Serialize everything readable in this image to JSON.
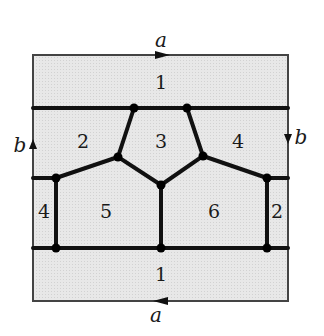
{
  "diagram": {
    "type": "torus-map-graph",
    "square": {
      "x": 33,
      "y": 55,
      "w": 255,
      "h": 246,
      "fill": "#e6e6e6",
      "stroke": "#444444"
    },
    "edge_labels": {
      "top": "a",
      "bottom": "a",
      "left": "b",
      "right": "b"
    },
    "region_labels": {
      "r1_top": "1",
      "r2": "2",
      "r3": "3",
      "r4": "4",
      "r4_left": "4",
      "r5": "5",
      "r6": "6",
      "r2_right": "2",
      "r1_bottom": "1"
    },
    "vertices": [
      {
        "x": 134,
        "y": 108
      },
      {
        "x": 187,
        "y": 108
      },
      {
        "x": 118,
        "y": 157
      },
      {
        "x": 203,
        "y": 156
      },
      {
        "x": 161,
        "y": 185
      },
      {
        "x": 56,
        "y": 178
      },
      {
        "x": 267,
        "y": 178
      },
      {
        "x": 56,
        "y": 248
      },
      {
        "x": 161,
        "y": 248
      },
      {
        "x": 267,
        "y": 248
      }
    ],
    "edge_color": "#111111",
    "vertex_color": "#000000"
  }
}
